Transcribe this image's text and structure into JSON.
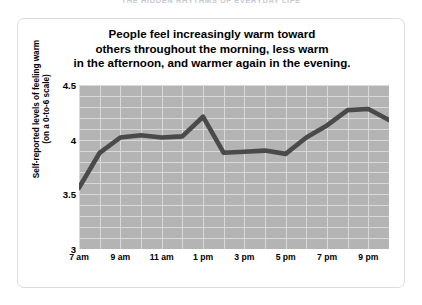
{
  "page_header": "THE HIDDEN RHYTHMS OF EVERYDAY LIFE",
  "figure": {
    "title_lines": [
      "People feel increasingly warm toward",
      "others throughout the morning, less warm",
      "in the afternoon, and warmer again in the evening."
    ],
    "y_axis_title_lines": [
      "Self-reported levels of feeling warm",
      "(on a 0-to-6 scale)"
    ]
  },
  "chart_data": {
    "type": "line",
    "title": "People feel increasingly warm toward others throughout the morning, less warm in the afternoon, and warmer again in the evening.",
    "xlabel": "",
    "ylabel": "Self-reported levels of feeling warm (on a 0-to-6 scale)",
    "x": [
      "7 am",
      "8 am",
      "9 am",
      "10 am",
      "11 am",
      "12 pm",
      "1 pm",
      "2 pm",
      "3 pm",
      "4 pm",
      "5 pm",
      "6 pm",
      "7 pm",
      "8 pm",
      "9 pm",
      "10 pm"
    ],
    "x_tick_labels": [
      "7 am",
      "9 am",
      "11 am",
      "1 pm",
      "3 pm",
      "5 pm",
      "7 pm",
      "9 pm"
    ],
    "x_tick_indices": [
      0,
      2,
      4,
      6,
      8,
      10,
      12,
      14
    ],
    "values": [
      3.56,
      3.88,
      4.02,
      4.04,
      4.02,
      4.03,
      4.21,
      3.88,
      3.89,
      3.9,
      3.87,
      4.02,
      4.13,
      4.27,
      4.28,
      4.18
    ],
    "ylim": [
      3,
      4.5
    ],
    "y_tick_labels": [
      "4.5",
      "4",
      "3.5",
      "3"
    ],
    "y_tick_values": [
      4.5,
      4,
      3.5,
      3
    ],
    "grid": true,
    "legend": "none",
    "series_color": "#4a4a4a",
    "plot_background": "#b4b4b4",
    "gridline_color": "#d9d9d9"
  }
}
